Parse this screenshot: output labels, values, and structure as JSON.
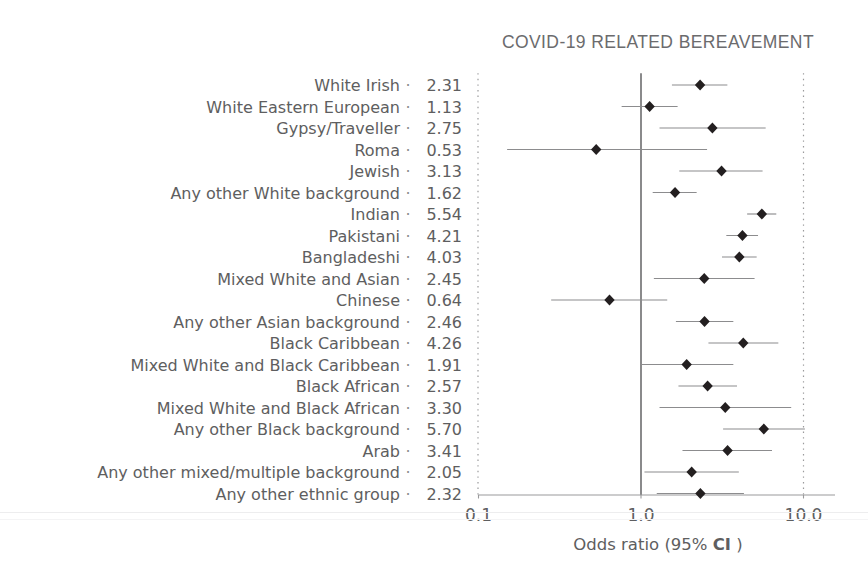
{
  "chart_data": {
    "type": "forest",
    "title": "COVID-19 RELATED BEREAVEMENT",
    "xlabel": "Odds ratio (95% CI )",
    "xlabel_plain": "Odds ratio (95% CI )",
    "xlabel_prefix": "Odds ratio (95% ",
    "xlabel_ci": "CI",
    "xlabel_suffix": " )",
    "xscale": "log",
    "xlim": [
      0.1,
      10.0
    ],
    "xticks": [
      0.1,
      1.0,
      10.0
    ],
    "xtick_labels": [
      "0.1",
      "1.0",
      "10.0"
    ],
    "reference_line": 1.0,
    "grid": false,
    "legend": "none",
    "marker": "diamond",
    "marker_color": "#231f20",
    "line_color": "#8c8c8e",
    "categories": [
      "White Irish",
      "White Eastern European",
      "Gypsy/Traveller",
      "Roma",
      "Jewish",
      "Any other White background",
      "Indian",
      "Pakistani",
      "Bangladeshi",
      "Mixed White and Asian",
      "Chinese",
      "Any other Asian background",
      "Black Caribbean",
      "Mixed White and Black Caribbean",
      "Black African",
      "Mixed White and Black African",
      "Any other Black background",
      "Arab",
      "Any other mixed/multiple background",
      "Any other ethnic group"
    ],
    "values": [
      2.31,
      1.13,
      2.75,
      0.53,
      3.13,
      1.62,
      5.54,
      4.21,
      4.03,
      2.45,
      0.64,
      2.46,
      4.26,
      1.91,
      2.57,
      3.3,
      5.7,
      3.41,
      2.05,
      2.32
    ],
    "value_labels": [
      "2.31",
      "1.13",
      "2.75",
      "0.53",
      "3.13",
      "1.62",
      "5.54",
      "4.21",
      "4.03",
      "2.45",
      "0.64",
      "2.46",
      "4.26",
      "1.91",
      "2.57",
      "3.30",
      "5.70",
      "3.41",
      "2.05",
      "2.32"
    ],
    "ci_low": [
      1.55,
      0.76,
      1.3,
      0.15,
      1.72,
      1.18,
      4.5,
      3.35,
      3.15,
      1.2,
      0.28,
      1.64,
      2.6,
      0.99,
      1.7,
      1.3,
      3.2,
      1.8,
      1.05,
      1.25
    ],
    "ci_high": [
      3.4,
      1.68,
      5.85,
      2.55,
      5.6,
      2.2,
      6.8,
      5.25,
      5.15,
      5.0,
      1.45,
      3.7,
      7.0,
      3.7,
      3.9,
      8.4,
      10.2,
      6.4,
      4.0,
      4.3
    ],
    "series_name": "Odds ratio"
  },
  "dot_separator": "·",
  "ticks_meta": {
    "t0": "0.1",
    "t1": "1.0",
    "t2": "10.0"
  }
}
